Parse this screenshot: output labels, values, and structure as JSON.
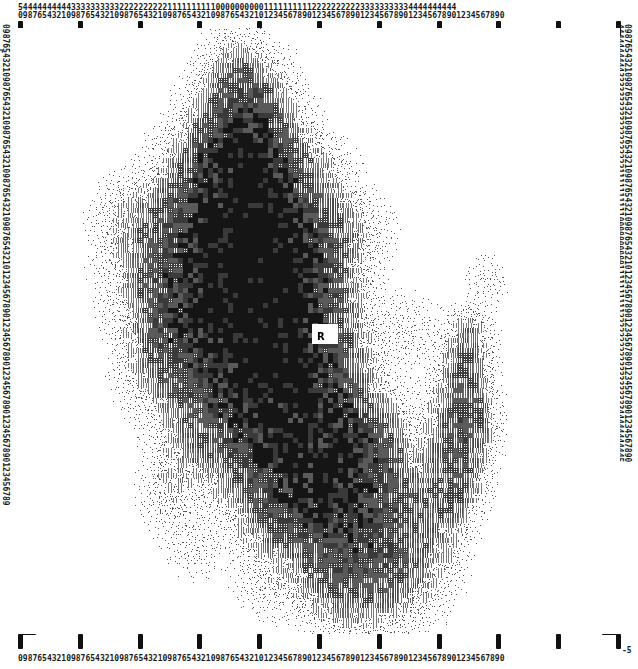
{
  "plot": {
    "type": "character-density-map",
    "marker_label": "R",
    "marker_x_px": 317,
    "marker_y_px": 331
  },
  "axes": {
    "top": {
      "tens_row": "5444444444433333333332222222222111111111100000000001111111111222222222233333333334444444444",
      "units_row": "09876543210987654321098765432109876543210987654321012345678901234567890123456789012345678901234567890",
      "tick_count": 11,
      "range_min": -50,
      "range_max": 50
    },
    "bottom": {
      "units_row": "09876543210987654321098765432109876543210987654321012345678901234567890123456789012345678901234567890",
      "corner_label": "-5",
      "tick_count": 11
    },
    "left": {
      "units_row": "0987654321098765432109876543210987654321098765432101234567890123456789012345678901234567890123456789",
      "corner_label": "-5",
      "tick_count": 11
    },
    "right": {
      "tens_row": "4444444444333333333322222222221111111111000000000011111111112222222222333333333344444444445",
      "units_row": "0987654321098765432109876543210987654321098765432101234567890123456789012345678901234567890",
      "tick_count": 11
    }
  },
  "chart_data": {
    "type": "heatmap",
    "title": "",
    "xlabel": "",
    "ylabel": "",
    "xlim": [
      -50,
      50
    ],
    "ylim": [
      -50,
      50
    ],
    "grid": false,
    "legend": "none",
    "annotations": [
      {
        "text": "R",
        "x": 0,
        "y": 0
      }
    ],
    "density_levels": [
      0,
      1,
      2,
      3,
      4,
      5
    ]
  },
  "colors": {
    "ink": "#101010",
    "paper": "#ffffff",
    "tick": "#101010"
  }
}
